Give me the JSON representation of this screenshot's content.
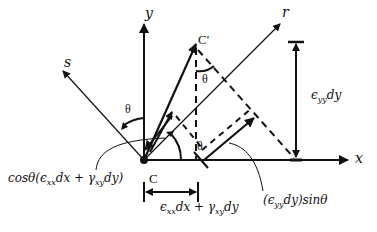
{
  "diagram": {
    "axes": {
      "x_label": "x",
      "y_label": "y",
      "r_label": "r",
      "s_label": "s"
    },
    "points": {
      "origin_label": "",
      "c_label": "C",
      "c_prime_label": "C'"
    },
    "angles": {
      "theta_1": "θ",
      "theta_2": "θ",
      "theta_3": "θ"
    },
    "annotations": {
      "cos_term": {
        "prefix": "cosθ(ϵ",
        "sub1": "xx",
        "mid1": "dx + γ",
        "sub2": "xy",
        "suffix": "dy)"
      },
      "x_displacement": {
        "prefix": "ϵ",
        "sub1": "xx",
        "mid1": "dx + γ",
        "sub2": "xy",
        "suffix": "dy"
      },
      "y_displacement": {
        "prefix": "ϵ",
        "sub1": "yy",
        "suffix": "dy"
      },
      "sin_term": {
        "prefix": "(ϵ",
        "sub1": "yy",
        "suffix": "dy)sinθ"
      }
    },
    "colors": {
      "stroke": "#111111",
      "background": "#ffffff"
    }
  }
}
